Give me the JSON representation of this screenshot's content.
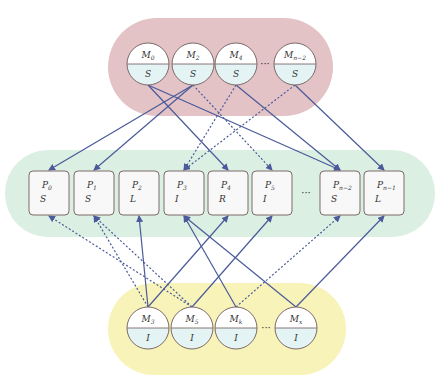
{
  "colors": {
    "top_group": "#e3c3c5",
    "mid_group": "#dcefe3",
    "bottom_group": "#f8f3b8",
    "node_fill_top": "#ffffff",
    "node_fill_bottom": "#e4f3f3",
    "node_stroke": "#7d6a6a",
    "box_fill": "#f8f8f8",
    "edge": "#4a5a9a"
  },
  "top_nodes": [
    {
      "name": "M",
      "sub": "0",
      "state": "S"
    },
    {
      "name": "M",
      "sub": "2",
      "state": "S"
    },
    {
      "name": "M",
      "sub": "4",
      "state": "S"
    },
    {
      "name": "M",
      "sub": "n−2",
      "state": "S"
    }
  ],
  "middle_nodes": [
    {
      "name": "P",
      "sub": "0",
      "state": "S"
    },
    {
      "name": "P",
      "sub": "1",
      "state": "S"
    },
    {
      "name": "P",
      "sub": "2",
      "state": "L"
    },
    {
      "name": "P",
      "sub": "3",
      "state": "I"
    },
    {
      "name": "P",
      "sub": "4",
      "state": "R"
    },
    {
      "name": "P",
      "sub": "5",
      "state": "I"
    },
    {
      "name": "P",
      "sub": "n−2",
      "state": "S"
    },
    {
      "name": "P",
      "sub": "n−1",
      "state": "L"
    }
  ],
  "bottom_nodes": [
    {
      "name": "M",
      "sub": "3",
      "state": "I"
    },
    {
      "name": "M",
      "sub": "5",
      "state": "I"
    },
    {
      "name": "M",
      "sub": "k",
      "state": "I"
    },
    {
      "name": "M",
      "sub": "x",
      "state": "I"
    }
  ],
  "ellipsis": "···",
  "edges_top": [
    {
      "from": "M0",
      "to": "P4",
      "style": "solid"
    },
    {
      "from": "M0",
      "to": "Pn-2",
      "style": "solid"
    },
    {
      "from": "M2",
      "to": "P0",
      "style": "solid"
    },
    {
      "from": "M2",
      "to": "P1",
      "style": "solid"
    },
    {
      "from": "M2",
      "to": "P5",
      "style": "dotted"
    },
    {
      "from": "M4",
      "to": "P3",
      "style": "dotted"
    },
    {
      "from": "M4",
      "to": "Pn-2",
      "style": "solid"
    },
    {
      "from": "Mn-2",
      "to": "P3",
      "style": "dotted"
    },
    {
      "from": "Mn-2",
      "to": "Pn-1",
      "style": "solid"
    }
  ],
  "edges_bottom": [
    {
      "from": "M3",
      "to": "P1",
      "style": "dotted"
    },
    {
      "from": "M3",
      "to": "P2",
      "style": "solid"
    },
    {
      "from": "M3",
      "to": "P4",
      "style": "solid"
    },
    {
      "from": "M5",
      "to": "P0",
      "style": "dotted"
    },
    {
      "from": "M5",
      "to": "P1",
      "style": "dotted"
    },
    {
      "from": "M5",
      "to": "P5",
      "style": "solid"
    },
    {
      "from": "Mk",
      "to": "P3",
      "style": "solid"
    },
    {
      "from": "Mk",
      "to": "Pn-2",
      "style": "dotted"
    },
    {
      "from": "Mx",
      "to": "P3",
      "style": "solid"
    },
    {
      "from": "Mx",
      "to": "Pn-1",
      "style": "solid"
    }
  ]
}
